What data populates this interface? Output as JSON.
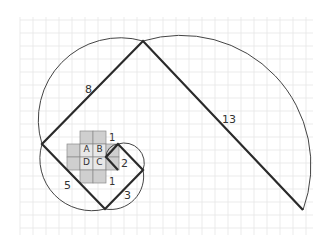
{
  "figure": {
    "colors": {
      "background": "#ffffff",
      "grid": "#e4e4e4",
      "cell_fill": "#cfcfcf",
      "cell_stroke": "#8a8a8a",
      "square_edges": "#2a2a2a",
      "spiral": "#444444"
    },
    "cell_labels": [
      "A",
      "B",
      "C",
      "D"
    ],
    "side_labels": {
      "one_top": "1",
      "one_bottom": "1",
      "two": "2",
      "three": "3",
      "five": "5",
      "eight": "8",
      "thirteen": "13"
    }
  }
}
